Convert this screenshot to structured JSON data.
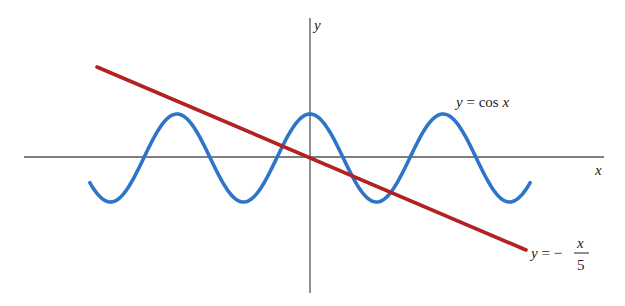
{
  "chart_data": {
    "type": "line",
    "title": "",
    "xlabel": "x",
    "ylabel": "y",
    "grid": false,
    "legend": "none (inline curve labels)",
    "xlim": [
      -10.4,
      13.8
    ],
    "ylim": [
      -3.1,
      3.2
    ],
    "series": [
      {
        "name": "y = cos x",
        "label": "y = cos x",
        "function": "cos(x)",
        "color": "#2e74c9",
        "x_range": [
          -10.4,
          10.4
        ],
        "x": [
          -10.4,
          -9.42,
          -6.28,
          -3.14,
          0,
          3.14,
          6.28,
          9.42,
          10.4
        ],
        "y": [
          -0.56,
          -1,
          1,
          -1,
          1,
          -1,
          1,
          -1,
          -0.56
        ]
      },
      {
        "name": "y = -x/5",
        "label_parts": {
          "lhs": "y = −",
          "num": "x",
          "den": "5"
        },
        "function": "-x/5",
        "color": "#b22222",
        "x_range": [
          -10,
          10.2
        ],
        "x": [
          -10,
          0,
          10.2
        ],
        "y": [
          2,
          0,
          -2.04
        ]
      }
    ],
    "annotations": [
      "y = cos x",
      "y = − x/5"
    ]
  },
  "axes": {
    "x_label": "x",
    "y_label": "y",
    "color": "#555555"
  },
  "labels": {
    "cos": {
      "y": "y",
      "eq": " = cos ",
      "x": "x"
    },
    "line": {
      "y": "y",
      "eq": " = −",
      "num": "x",
      "den": "5"
    }
  },
  "geometry": {
    "origin_px": [
      310,
      158
    ],
    "x_unit_px": 21.17,
    "y_unit_px": 44,
    "line_start_px": [
      97,
      67
    ],
    "line_end_px": [
      526,
      250
    ]
  }
}
